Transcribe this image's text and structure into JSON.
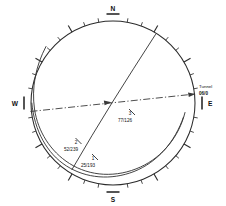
{
  "diagram": {
    "type": "stereonet",
    "projection": "equal-area lower hemisphere",
    "center_x": 113,
    "center_y": 103,
    "radius": 82,
    "cardinals": [
      {
        "label": "N",
        "bearing": 0,
        "name": "cardinal-north"
      },
      {
        "label": "E",
        "bearing": 90,
        "name": "cardinal-east"
      },
      {
        "label": "S",
        "bearing": 180,
        "name": "cardinal-south"
      },
      {
        "label": "W",
        "bearing": 270,
        "name": "cardinal-west"
      }
    ],
    "tick_major_interval_deg": 30,
    "tick_minor_interval_deg": 10,
    "planes": [
      {
        "id": "1",
        "value": "25/193",
        "dip": 25,
        "dip_direction": 193,
        "label_x": 88,
        "label_y": 166,
        "id_x": 93,
        "id_y": 160
      },
      {
        "id": "2",
        "value": "52/239",
        "dip": 52,
        "dip_direction": 239,
        "label_x": 71,
        "label_y": 150,
        "id_x": 76,
        "id_y": 144
      },
      {
        "id": "3",
        "value": "77/126",
        "dip": 77,
        "dip_direction": 126,
        "label_x": 125,
        "label_y": 121,
        "id_x": 130,
        "id_y": 115
      }
    ],
    "tunnel": {
      "label": "Tunnel",
      "value": "06/0",
      "plunge": 6,
      "trend": 0,
      "label_x": 199,
      "label_y": 88,
      "value_x": 199,
      "value_y": 95
    }
  }
}
